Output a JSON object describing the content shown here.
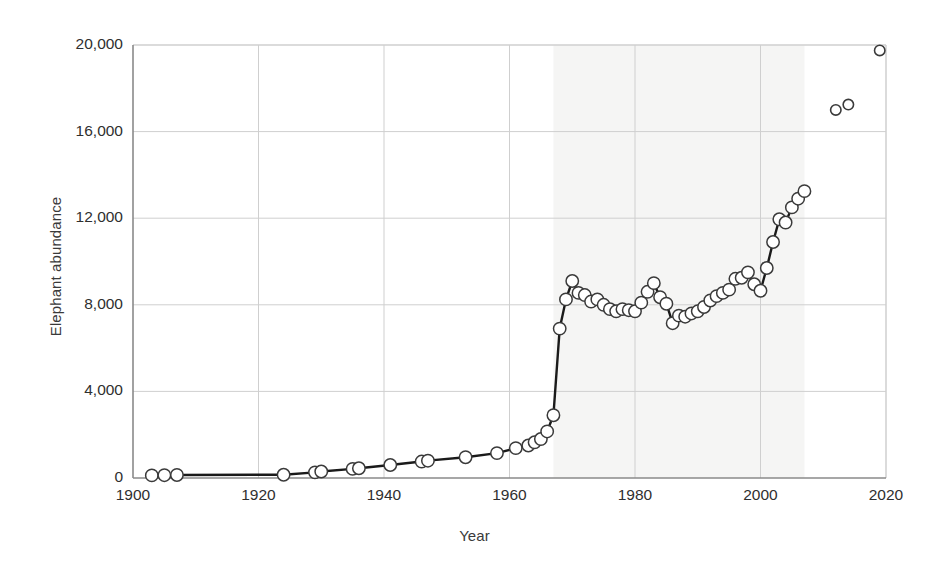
{
  "chart_data": {
    "type": "line",
    "title": "",
    "xlabel": "Year",
    "ylabel": "Elephant abundance",
    "xlim": [
      1900,
      2020
    ],
    "ylim": [
      0,
      20000
    ],
    "xticks": [
      1900,
      1920,
      1940,
      1960,
      1980,
      2000,
      2020
    ],
    "xtick_labels": [
      "1900",
      "1920",
      "1940",
      "1960",
      "1980",
      "2000",
      "2020"
    ],
    "yticks": [
      0,
      4000,
      8000,
      12000,
      16000,
      20000
    ],
    "ytick_labels": [
      "0",
      "4,000",
      "8,000",
      "12,000",
      "16,000",
      "20,000"
    ],
    "grid": true,
    "legend": null,
    "marker": "open-circle",
    "marker_facecolor": "#ffffff",
    "marker_edgecolor": "#3a3a3a",
    "line_color": "#1a1a1a",
    "grid_color": "#cfcfcf",
    "axis_color": "#8a8a8a",
    "series": [
      {
        "name": "Elephant abundance (survey series)",
        "connected": true,
        "x": [
          1903,
          1905,
          1907,
          1924,
          1929,
          1930,
          1935,
          1936,
          1941,
          1946,
          1947,
          1953,
          1958,
          1961,
          1963,
          1964,
          1965,
          1966,
          1967,
          1968,
          1969,
          1970,
          1971,
          1972,
          1973,
          1974,
          1975,
          1976,
          1977,
          1978,
          1979,
          1980,
          1981,
          1982,
          1983,
          1984,
          1985,
          1986,
          1987,
          1988,
          1989,
          1990,
          1991,
          1992,
          1993,
          1994,
          1995,
          1996,
          1997,
          1998,
          1999,
          2000,
          2001,
          2002,
          2003,
          2004,
          2005,
          2006,
          2007
        ],
        "y": [
          120,
          130,
          140,
          150,
          260,
          300,
          420,
          450,
          600,
          760,
          800,
          960,
          1150,
          1380,
          1500,
          1650,
          1800,
          2150,
          2900,
          6900,
          8250,
          9100,
          8550,
          8450,
          8150,
          8250,
          8000,
          7800,
          7700,
          7800,
          7750,
          7700,
          8100,
          8600,
          9000,
          8350,
          8050,
          7150,
          7500,
          7450,
          7600,
          7700,
          7900,
          8200,
          8400,
          8550,
          8700,
          9200,
          9250,
          9500,
          8950,
          8650,
          9700,
          10900,
          11950,
          11800,
          12500,
          12900,
          13250
        ]
      },
      {
        "name": "Recent isolated surveys",
        "connected": false,
        "x": [
          2012,
          2014,
          2019
        ],
        "y": [
          17000,
          17250,
          19750
        ]
      }
    ]
  }
}
